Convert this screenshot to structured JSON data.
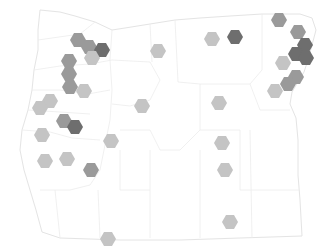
{
  "map": {
    "region": "Oregon",
    "type": "hexbin",
    "colors": {
      "light": "#c4c4c4",
      "medium": "#9a9a9a",
      "dark": "#6e6e6e",
      "border": "#e6e6e6"
    },
    "hexes": [
      {
        "x": 78,
        "y": 40,
        "shade": "medium"
      },
      {
        "x": 89,
        "y": 47,
        "shade": "medium"
      },
      {
        "x": 102,
        "y": 50,
        "shade": "dark"
      },
      {
        "x": 92,
        "y": 58,
        "shade": "light"
      },
      {
        "x": 69,
        "y": 61,
        "shade": "medium"
      },
      {
        "x": 69,
        "y": 74,
        "shade": "medium"
      },
      {
        "x": 70,
        "y": 87,
        "shade": "medium"
      },
      {
        "x": 84,
        "y": 91,
        "shade": "light"
      },
      {
        "x": 50,
        "y": 101,
        "shade": "light"
      },
      {
        "x": 40,
        "y": 108,
        "shade": "light"
      },
      {
        "x": 64,
        "y": 121,
        "shade": "medium"
      },
      {
        "x": 75,
        "y": 127,
        "shade": "dark"
      },
      {
        "x": 42,
        "y": 135,
        "shade": "light"
      },
      {
        "x": 67,
        "y": 159,
        "shade": "light"
      },
      {
        "x": 45,
        "y": 161,
        "shade": "light"
      },
      {
        "x": 91,
        "y": 170,
        "shade": "medium"
      },
      {
        "x": 111,
        "y": 141,
        "shade": "light"
      },
      {
        "x": 158,
        "y": 51,
        "shade": "light"
      },
      {
        "x": 142,
        "y": 106,
        "shade": "light"
      },
      {
        "x": 212,
        "y": 39,
        "shade": "light"
      },
      {
        "x": 235,
        "y": 37,
        "shade": "dark"
      },
      {
        "x": 219,
        "y": 103,
        "shade": "light"
      },
      {
        "x": 222,
        "y": 143,
        "shade": "light"
      },
      {
        "x": 225,
        "y": 170,
        "shade": "light"
      },
      {
        "x": 230,
        "y": 222,
        "shade": "light"
      },
      {
        "x": 108,
        "y": 239,
        "shade": "light"
      },
      {
        "x": 279,
        "y": 20,
        "shade": "medium"
      },
      {
        "x": 298,
        "y": 32,
        "shade": "medium"
      },
      {
        "x": 305,
        "y": 45,
        "shade": "dark"
      },
      {
        "x": 296,
        "y": 54,
        "shade": "dark"
      },
      {
        "x": 306,
        "y": 58,
        "shade": "dark"
      },
      {
        "x": 283,
        "y": 63,
        "shade": "light"
      },
      {
        "x": 296,
        "y": 77,
        "shade": "medium"
      },
      {
        "x": 288,
        "y": 84,
        "shade": "medium"
      },
      {
        "x": 275,
        "y": 91,
        "shade": "light"
      }
    ]
  }
}
